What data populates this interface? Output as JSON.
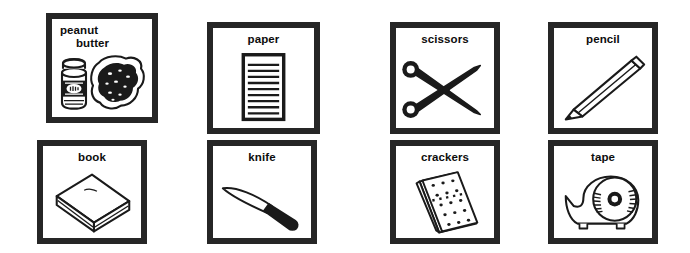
{
  "sheet": {
    "background_color": "#ffffff",
    "ink_color": "#262626",
    "label_color": "#0d0d0d",
    "columns": 4,
    "rows": 2
  },
  "cards": [
    {
      "id": "peanut-butter",
      "label_line1": "peanut",
      "label_line2": "butter",
      "label": "peanut butter",
      "icon": "peanut-butter-jar-and-bread-icon",
      "x": 46,
      "y": 13,
      "w": 112,
      "h": 110,
      "two_line": true
    },
    {
      "id": "paper",
      "label_line1": "paper",
      "label_line2": "",
      "label": "paper",
      "icon": "lined-paper-pad-icon",
      "x": 207,
      "y": 22,
      "w": 113,
      "h": 112,
      "two_line": false
    },
    {
      "id": "scissors",
      "label_line1": "scissors",
      "label_line2": "",
      "label": "scissors",
      "icon": "scissors-icon",
      "x": 390,
      "y": 22,
      "w": 110,
      "h": 112,
      "two_line": false
    },
    {
      "id": "pencil",
      "label_line1": "pencil",
      "label_line2": "",
      "label": "pencil",
      "icon": "pencil-icon",
      "x": 548,
      "y": 22,
      "w": 110,
      "h": 112,
      "two_line": false
    },
    {
      "id": "book",
      "label_line1": "book",
      "label_line2": "",
      "label": "book",
      "icon": "closed-book-icon",
      "x": 37,
      "y": 140,
      "w": 110,
      "h": 104,
      "two_line": false
    },
    {
      "id": "knife",
      "label_line1": "knife",
      "label_line2": "",
      "label": "knife",
      "icon": "table-knife-icon",
      "x": 207,
      "y": 140,
      "w": 110,
      "h": 104,
      "two_line": false
    },
    {
      "id": "crackers",
      "label_line1": "crackers",
      "label_line2": "",
      "label": "crackers",
      "icon": "cracker-stack-icon",
      "x": 390,
      "y": 140,
      "w": 110,
      "h": 104,
      "two_line": false
    },
    {
      "id": "tape",
      "label_line1": "tape",
      "label_line2": "",
      "label": "tape",
      "icon": "tape-dispenser-icon",
      "x": 548,
      "y": 140,
      "w": 110,
      "h": 104,
      "two_line": false
    }
  ]
}
